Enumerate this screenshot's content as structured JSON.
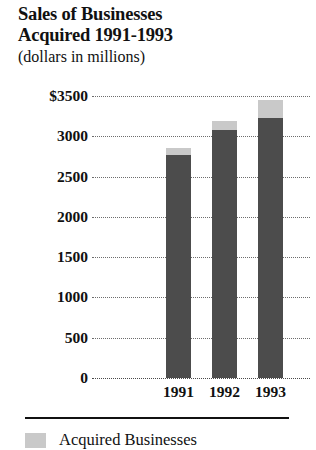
{
  "chart_data": {
    "type": "bar",
    "title": "Sales of Businesses Acquired 1991-1993",
    "title_lines": [
      "Sales of Businesses",
      "Acquired 1991-1993"
    ],
    "subtitle": "(dollars in millions)",
    "xlabel": "",
    "ylabel": "",
    "ylim": [
      0,
      3500
    ],
    "grid": true,
    "stacked": true,
    "legend_position": "bottom-left",
    "categories": [
      "1991",
      "1992",
      "1993"
    ],
    "ytick_labels": [
      "$3500",
      "3000",
      "2500",
      "2000",
      "1500",
      "1000",
      "500",
      "0"
    ],
    "ytick_values": [
      3500,
      3000,
      2500,
      2000,
      1500,
      1000,
      500,
      0
    ],
    "series": [
      {
        "name": "Base Sales",
        "color": "#4c4c4c",
        "values": [
          2770,
          3080,
          3230
        ]
      },
      {
        "name": "Acquired Businesses",
        "color": "#c9c9c9",
        "values": [
          85,
          110,
          220
        ]
      }
    ],
    "totals": [
      2855,
      3190,
      3450
    ]
  },
  "legend": {
    "entries": [
      {
        "label": "Acquired Businesses",
        "color": "#c9c9c9"
      }
    ]
  },
  "colors": {
    "base": "#4c4c4c",
    "acquired": "#c9c9c9",
    "text": "#111111",
    "grid": "#6d6d6d",
    "background": "#ffffff"
  }
}
